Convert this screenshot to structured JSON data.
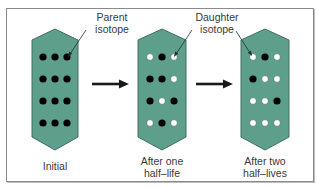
{
  "diagram": {
    "colors": {
      "panel_fill": "#5e9f8c",
      "panel_stroke": "#3f6f61",
      "parent_dot": "#000000",
      "daughter_dot": "#ffffff",
      "arrow": "#1a1a1a",
      "frame": "#8a8a8a",
      "text": "#3a3a3a"
    },
    "callouts": {
      "parent": {
        "line1": "Parent",
        "line2": "isotope"
      },
      "daughter": {
        "line1": "Daughter",
        "line2": "isotope"
      }
    },
    "legend": {
      "parent_symbol": "black filled circle",
      "daughter_symbol": "white filled circle"
    },
    "panels": [
      {
        "id": "initial",
        "caption_line1": "Initial",
        "caption_line2": "",
        "grid": [
          [
            "P",
            "P",
            "P"
          ],
          [
            "P",
            "P",
            "P"
          ],
          [
            "P",
            "P",
            "P"
          ],
          [
            "P",
            "P",
            "P"
          ]
        ],
        "parent_count": 12,
        "daughter_count": 0
      },
      {
        "id": "after-one-half-life",
        "caption_line1": "After one",
        "caption_line2": "half–life",
        "grid": [
          [
            "D",
            "P",
            "D"
          ],
          [
            "P",
            "P",
            "D"
          ],
          [
            "P",
            "D",
            "P"
          ],
          [
            "D",
            "P",
            "D"
          ]
        ],
        "parent_count": 6,
        "daughter_count": 6
      },
      {
        "id": "after-two-half-lives",
        "caption_line1": "After two",
        "caption_line2": "half–lives",
        "grid": [
          [
            "D",
            "P",
            "D"
          ],
          [
            "P",
            "D",
            "D"
          ],
          [
            "D",
            "D",
            "P"
          ],
          [
            "D",
            "D",
            "D"
          ]
        ],
        "parent_count": 3,
        "daughter_count": 9
      }
    ],
    "arrows": [
      {
        "from": "initial",
        "to": "after-one-half-life"
      },
      {
        "from": "after-one-half-life",
        "to": "after-two-half-lives"
      }
    ]
  }
}
